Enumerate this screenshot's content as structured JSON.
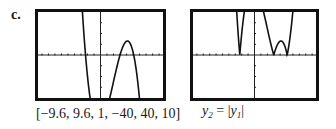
{
  "part_label": "c.",
  "screens": [
    {
      "window_caption": "[−9.6, 9.6, 1, −40, 40, 10]",
      "window": {
        "xmin": -9.6,
        "xmax": 9.6,
        "xscl": 1,
        "ymin": -40,
        "ymax": 40,
        "yscl": 10
      },
      "function": "y1",
      "absolute": false
    },
    {
      "caption_lhs": "y",
      "caption_lhs_sub": "2",
      "caption_eq": " = ",
      "caption_rhs": "y",
      "caption_rhs_sub": "1",
      "window": {
        "xmin": -9.6,
        "xmax": 9.6,
        "xscl": 1,
        "ymin": -40,
        "ymax": 40,
        "yscl": 10
      },
      "function": "y2 = |y1|",
      "absolute": true
    }
  ],
  "chart_data": [
    {
      "type": "line",
      "title": "y1 graph",
      "xlim": [
        -9.6,
        9.6
      ],
      "ylim": [
        -40,
        40
      ],
      "x_tick_step": 1,
      "y_tick_step": 10,
      "features": {
        "zeros": [
          -2.3,
          3,
          5.1
        ],
        "y_intercept": -37,
        "local_max": {
          "x": 4.1,
          "y": 16
        },
        "local_min": {
          "x": 0,
          "y": -37
        }
      },
      "model_roots": [
        -2.3,
        3.0,
        5.1
      ],
      "model_scale": -1.85
    },
    {
      "type": "line",
      "title": "y2 = |y1|",
      "xlim": [
        -9.6,
        9.6
      ],
      "ylim": [
        -40,
        40
      ],
      "x_tick_step": 1,
      "y_tick_step": 10,
      "features": {
        "zeros": [
          -2.3,
          3,
          5.1
        ],
        "peak_at_yaxis": 37,
        "local_max": {
          "x": 4.1,
          "y": 16
        }
      },
      "model_roots": [
        -2.3,
        3.0,
        5.1
      ],
      "model_scale": -1.85,
      "absolute": true
    }
  ]
}
